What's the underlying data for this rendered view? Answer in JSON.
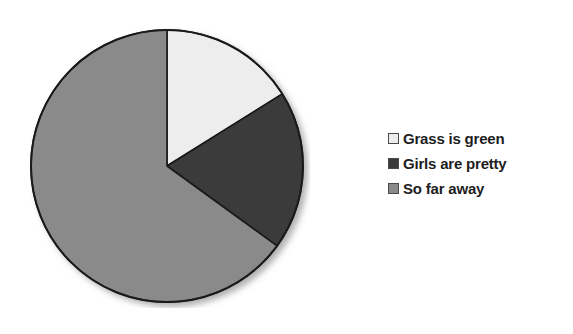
{
  "canvas": {
    "width": 573,
    "height": 334,
    "background": "#ffffff"
  },
  "chart_data": {
    "type": "pie",
    "title": "",
    "subtitle": "",
    "xlabel": "",
    "ylabel": "",
    "grid": false,
    "legend_position": "right",
    "categories": [
      "Grass is green",
      "Girls are pretty",
      "So far away"
    ],
    "values": [
      16,
      19,
      65
    ],
    "units": "percent",
    "slices": [
      {
        "label": "Grass is green",
        "value": 16,
        "percent": 16,
        "color": "#ededed",
        "start_angle_deg": 0,
        "end_angle_deg": 58
      },
      {
        "label": "Girls are pretty",
        "value": 19,
        "percent": 19,
        "color": "#3a3a3a",
        "start_angle_deg": 58,
        "end_angle_deg": 126
      },
      {
        "label": "So far away",
        "value": 65,
        "percent": 65,
        "color": "#8a8a8a",
        "start_angle_deg": 126,
        "end_angle_deg": 360
      }
    ],
    "start_angle_deg": 0,
    "direction": "clockwise",
    "data_labels_shown": false,
    "geometry": {
      "center_x": 137,
      "center_y": 138,
      "radius": 136,
      "outline_color": "#1a1a1a",
      "outline_width": 2,
      "shadow": true
    }
  },
  "legend": {
    "items": [
      {
        "label": "Grass is green",
        "color": "#ededed",
        "border": "#4a4a4a"
      },
      {
        "label": "Girls are pretty",
        "color": "#3a3a3a",
        "border": "#4a4a4a"
      },
      {
        "label": "So far away",
        "color": "#8a8a8a",
        "border": "#4a4a4a"
      }
    ]
  }
}
